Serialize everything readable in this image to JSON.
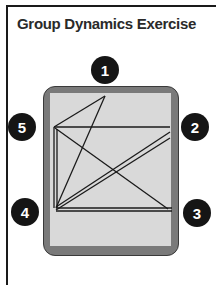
{
  "title": "Group Dynamics Exercise",
  "positions": [
    {
      "id": "1",
      "label": "1",
      "x": 105,
      "y": 70
    },
    {
      "id": "2",
      "label": "2",
      "x": 195,
      "y": 127
    },
    {
      "id": "3",
      "label": "3",
      "x": 197,
      "y": 213
    },
    {
      "id": "4",
      "label": "4",
      "x": 25,
      "y": 212
    },
    {
      "id": "5",
      "label": "5",
      "x": 22,
      "y": 127
    }
  ],
  "connections": [
    {
      "from": "5",
      "to": "1"
    },
    {
      "from": "1",
      "to": "4"
    },
    {
      "from": "5",
      "to": "2"
    },
    {
      "from": "5",
      "to": "4",
      "double": true
    },
    {
      "from": "5",
      "to": "3"
    },
    {
      "from": "4",
      "to": "2",
      "double": true
    },
    {
      "from": "4",
      "to": "3",
      "double": true
    }
  ],
  "colors": {
    "badge": "#151515",
    "table_border": "#7a7a7a",
    "table_surface": "#d9d9d9",
    "line": "#1a1a1a"
  }
}
